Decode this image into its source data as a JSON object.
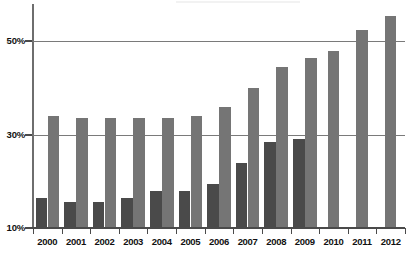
{
  "chart_data": {
    "type": "bar",
    "title": "",
    "subtitle": "",
    "xlabel": "",
    "ylabel": "",
    "ylim": [
      10,
      58
    ],
    "yticks": [
      10,
      30,
      50
    ],
    "ytick_labels": [
      "10%",
      "30%",
      "50%"
    ],
    "grid": "horizontal",
    "legend": "none",
    "categories": [
      "2000",
      "2001",
      "2002",
      "2003",
      "2004",
      "2005",
      "2006",
      "2007",
      "2008",
      "2009",
      "2010",
      "2011",
      "2012"
    ],
    "series": [
      {
        "name": "dark-series",
        "color": "#4a4a4a",
        "values": [
          16.5,
          15.5,
          15.5,
          16.5,
          18.0,
          18.0,
          19.5,
          24.0,
          28.5,
          29.0,
          null,
          null,
          null
        ]
      },
      {
        "name": "light-series",
        "color": "#757575",
        "values": [
          34.0,
          33.5,
          33.5,
          33.5,
          33.5,
          34.0,
          36.0,
          40.0,
          44.5,
          46.5,
          48.0,
          52.5,
          55.5
        ]
      }
    ]
  },
  "axes": {
    "y_labels": [
      "50%",
      "30%",
      "10%"
    ],
    "x_labels": [
      "2000",
      "2001",
      "2002",
      "2003",
      "2004",
      "2005",
      "2006",
      "2007",
      "2008",
      "2009",
      "2010",
      "2011",
      "2012"
    ]
  },
  "colors": {
    "dark_bar": "#4a4a4a",
    "light_bar": "#757575",
    "gridline": "#7a7a7a",
    "axis": "#4a4a4a",
    "background": "#ffffff",
    "text": "#111111"
  }
}
